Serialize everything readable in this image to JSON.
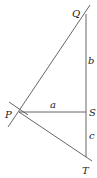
{
  "diagram": {
    "points": {
      "Q": {
        "label": "Q",
        "x": 86,
        "y": 14
      },
      "P": {
        "label": "P",
        "x": 19,
        "y": 112
      },
      "S": {
        "label": "S",
        "x": 86,
        "y": 112
      },
      "T": {
        "label": "T",
        "x": 86,
        "y": 157
      }
    },
    "segments": {
      "a": {
        "label": "a",
        "from": "P",
        "to": "S"
      },
      "b": {
        "label": "b",
        "from": "Q",
        "to": "S"
      },
      "c": {
        "label": "c",
        "from": "S",
        "to": "T"
      }
    },
    "lines": [
      "line QP extended",
      "PT",
      "QT vertical"
    ]
  }
}
